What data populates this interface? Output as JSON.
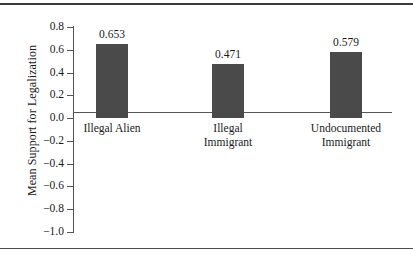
{
  "chart_data": {
    "type": "bar",
    "title": "",
    "subtitle": "",
    "xlabel": "",
    "ylabel": "Mean Support for Legalization",
    "categories": [
      "Illegal Alien",
      "Illegal Immigrant",
      "Undocumented Immigrant"
    ],
    "category_lines": [
      [
        "Illegal Alien"
      ],
      [
        "Illegal",
        "Immigrant"
      ],
      [
        "Undocumented",
        "Immigrant"
      ]
    ],
    "values": [
      0.653,
      0.471,
      0.579
    ],
    "value_labels": [
      "0.653",
      "0.471",
      "0.579"
    ],
    "ylim": [
      -1.0,
      0.8
    ],
    "ytick_values": [
      0.8,
      0.6,
      0.4,
      0.2,
      0.0,
      -0.2,
      -0.4,
      -0.6,
      -0.8,
      -1.0
    ],
    "ytick_labels": [
      "0.8",
      "0.6",
      "0.4",
      "0.2",
      "0.0",
      "−0.2",
      "−0.4",
      "−0.6",
      "−0.8",
      "−1.0"
    ],
    "grid": false,
    "legend": null,
    "legend_position": "none",
    "bar_color": "#4a4a4a",
    "axis_color": "#555555",
    "rule_color": "#3a3a3a",
    "background": "#ffffff"
  }
}
